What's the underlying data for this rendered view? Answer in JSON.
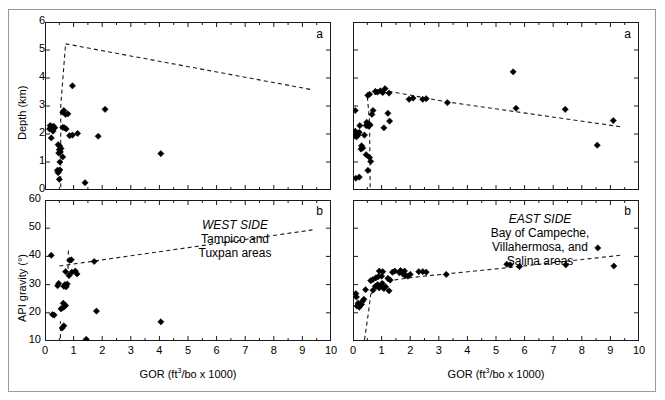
{
  "figure": {
    "axis_labels": {
      "x": "GOR (ft3/bo x 1000)",
      "x_main": "GOR (ft",
      "x_sup": "3",
      "x_rest": "/bo x 1000)",
      "y_depth": "Depth (km)",
      "y_api": "API gravity (°)"
    },
    "panel_letters": {
      "a": "a",
      "b": "b"
    }
  },
  "annotations": {
    "west": {
      "title": "WEST SIDE",
      "lines": [
        "Tampico and",
        "Tuxpan areas"
      ]
    },
    "east": {
      "title": "EAST SIDE",
      "lines": [
        "Bay of Campeche,",
        "Villahermosa, and",
        "Salina areas"
      ]
    }
  },
  "chart_data": [
    {
      "id": "west-depth",
      "type": "scatter",
      "panel": "a",
      "title": "",
      "xlabel": "GOR (ft3/bo x 1000)",
      "ylabel": "Depth (km)",
      "xlim": [
        0,
        10
      ],
      "ylim": [
        6,
        0
      ],
      "y_inverted": true,
      "xticks": [
        0,
        1,
        2,
        3,
        4,
        5,
        6,
        7,
        8,
        9,
        10
      ],
      "yticks": [
        0,
        1,
        2,
        3,
        4,
        5,
        6
      ],
      "xminor_step": 0.5,
      "grid": false,
      "legend": "none",
      "points": [
        [
          0.46,
          0.62
        ],
        [
          0.47,
          0.68
        ],
        [
          0.43,
          0.7
        ],
        [
          0.52,
          0.72
        ],
        [
          0.5,
          0.38
        ],
        [
          1.4,
          0.26
        ],
        [
          0.52,
          1.0
        ],
        [
          0.62,
          1.18
        ],
        [
          0.48,
          1.32
        ],
        [
          0.54,
          1.36
        ],
        [
          0.5,
          1.44
        ],
        [
          0.56,
          1.48
        ],
        [
          0.52,
          1.56
        ],
        [
          0.46,
          1.62
        ],
        [
          4.05,
          1.3
        ],
        [
          0.22,
          1.86
        ],
        [
          0.28,
          2.1
        ],
        [
          0.16,
          2.18
        ],
        [
          0.2,
          2.22
        ],
        [
          0.24,
          2.26
        ],
        [
          0.18,
          2.3
        ],
        [
          0.3,
          2.28
        ],
        [
          0.34,
          2.22
        ],
        [
          0.62,
          2.24
        ],
        [
          0.68,
          2.22
        ],
        [
          0.74,
          2.18
        ],
        [
          0.86,
          1.94
        ],
        [
          0.96,
          1.96
        ],
        [
          1.14,
          2.02
        ],
        [
          1.86,
          1.92
        ],
        [
          0.62,
          2.78
        ],
        [
          0.66,
          2.84
        ],
        [
          0.72,
          2.7
        ],
        [
          0.8,
          2.72
        ],
        [
          2.1,
          2.88
        ],
        [
          0.96,
          3.72
        ]
      ],
      "trend_lines": [
        {
          "name": "lower-bound-vertical",
          "style": "dashed",
          "path": [
            [
              0.55,
              0.1
            ],
            [
              0.55,
              3.0
            ],
            [
              0.72,
              5.22
            ]
          ]
        },
        {
          "name": "lower-envelope",
          "style": "dashed",
          "path": [
            [
              0.72,
              5.22
            ],
            [
              9.35,
              3.58
            ]
          ]
        }
      ]
    },
    {
      "id": "west-api",
      "type": "scatter",
      "panel": "b",
      "title": "",
      "xlabel": "GOR (ft3/bo x 1000)",
      "ylabel": "API gravity (°)",
      "xlim": [
        0,
        10
      ],
      "ylim": [
        60,
        10
      ],
      "y_inverted": true,
      "xticks": [
        0,
        1,
        2,
        3,
        4,
        5,
        6,
        7,
        8,
        9,
        10
      ],
      "yticks": [
        10,
        20,
        30,
        40,
        50,
        60
      ],
      "xminor_step": 0.5,
      "grid": false,
      "legend": "none",
      "points": [
        [
          1.44,
          10.6
        ],
        [
          0.6,
          14.6
        ],
        [
          0.66,
          15.4
        ],
        [
          4.05,
          16.8
        ],
        [
          0.26,
          19.4
        ],
        [
          0.32,
          19.2
        ],
        [
          0.56,
          21.4
        ],
        [
          0.62,
          21.8
        ],
        [
          0.68,
          22.2
        ],
        [
          0.72,
          22.6
        ],
        [
          0.64,
          23.4
        ],
        [
          1.8,
          20.6
        ],
        [
          0.44,
          29.6
        ],
        [
          0.48,
          30.4
        ],
        [
          0.66,
          29.4
        ],
        [
          0.7,
          30.0
        ],
        [
          0.74,
          29.2
        ],
        [
          0.78,
          30.2
        ],
        [
          0.84,
          33.2
        ],
        [
          0.72,
          34.6
        ],
        [
          0.94,
          34.4
        ],
        [
          1.06,
          34.8
        ],
        [
          1.12,
          33.8
        ],
        [
          0.86,
          38.6
        ],
        [
          0.92,
          38.8
        ],
        [
          1.72,
          38.2
        ],
        [
          0.22,
          40.4
        ]
      ],
      "trend_lines": [
        {
          "name": "left-boundary-vertical",
          "style": "dashed",
          "path": [
            [
              0.54,
              11.0
            ],
            [
              0.54,
              17.0
            ]
          ]
        },
        {
          "name": "left-boundary-vertical-2",
          "style": "dashed",
          "path": [
            [
              0.8,
              33.0
            ],
            [
              0.82,
              42.5
            ]
          ]
        },
        {
          "name": "api-envelope",
          "style": "dashed",
          "path": [
            [
              0.5,
              36.6
            ],
            [
              9.35,
              49.4
            ]
          ]
        }
      ]
    },
    {
      "id": "east-depth",
      "type": "scatter",
      "panel": "a",
      "title": "",
      "xlabel": "GOR (ft3/bo x 1000)",
      "ylabel": "Depth (km)",
      "xlim": [
        0,
        10
      ],
      "ylim": [
        6,
        0
      ],
      "y_inverted": true,
      "xticks": [
        0,
        1,
        2,
        3,
        4,
        5,
        6,
        7,
        8,
        9,
        10
      ],
      "yticks": [
        0,
        1,
        2,
        3,
        4,
        5,
        6
      ],
      "xminor_step": 0.5,
      "grid": false,
      "legend": "none",
      "points": [
        [
          0.1,
          0.42
        ],
        [
          0.22,
          0.46
        ],
        [
          0.52,
          0.7
        ],
        [
          0.62,
          1.02
        ],
        [
          0.46,
          1.26
        ],
        [
          0.58,
          1.16
        ],
        [
          0.28,
          1.46
        ],
        [
          0.34,
          1.5
        ],
        [
          0.3,
          1.58
        ],
        [
          0.06,
          1.94
        ],
        [
          0.12,
          1.9
        ],
        [
          0.18,
          1.96
        ],
        [
          0.14,
          2.02
        ],
        [
          0.22,
          2.06
        ],
        [
          0.08,
          2.1
        ],
        [
          0.4,
          1.96
        ],
        [
          0.24,
          2.3
        ],
        [
          0.46,
          2.3
        ],
        [
          0.5,
          2.34
        ],
        [
          0.54,
          2.28
        ],
        [
          0.56,
          2.36
        ],
        [
          0.6,
          2.32
        ],
        [
          0.48,
          2.42
        ],
        [
          1.08,
          2.22
        ],
        [
          1.28,
          2.46
        ],
        [
          1.22,
          2.74
        ],
        [
          0.66,
          2.7
        ],
        [
          0.7,
          2.84
        ],
        [
          0.08,
          2.84
        ],
        [
          0.52,
          3.38
        ],
        [
          0.58,
          3.42
        ],
        [
          0.78,
          3.52
        ],
        [
          0.86,
          3.5
        ],
        [
          0.96,
          3.54
        ],
        [
          1.04,
          3.48
        ],
        [
          1.12,
          3.62
        ],
        [
          1.26,
          3.46
        ],
        [
          1.96,
          3.24
        ],
        [
          2.1,
          3.28
        ],
        [
          2.44,
          3.24
        ],
        [
          2.56,
          3.26
        ],
        [
          3.3,
          3.12
        ],
        [
          5.6,
          4.22
        ],
        [
          5.7,
          2.92
        ],
        [
          7.42,
          2.88
        ],
        [
          8.54,
          1.6
        ],
        [
          9.1,
          2.48
        ]
      ],
      "trend_lines": [
        {
          "name": "left-boundary-vertical",
          "style": "dashed",
          "path": [
            [
              0.6,
              0.1
            ],
            [
              0.58,
              2.4
            ],
            [
              0.5,
              3.36
            ]
          ]
        },
        {
          "name": "lower-envelope",
          "style": "dashed",
          "path": [
            [
              0.5,
              3.36
            ],
            [
              1.3,
              3.52
            ],
            [
              3.2,
              3.16
            ],
            [
              9.35,
              2.26
            ]
          ]
        }
      ]
    },
    {
      "id": "east-api",
      "type": "scatter",
      "panel": "b",
      "title": "",
      "xlabel": "GOR (ft3/bo x 1000)",
      "ylabel": "API gravity (°)",
      "xlim": [
        0,
        10
      ],
      "ylim": [
        60,
        10
      ],
      "y_inverted": true,
      "xticks": [
        0,
        1,
        2,
        3,
        4,
        5,
        6,
        7,
        8,
        9,
        10
      ],
      "yticks": [
        10,
        20,
        30,
        40,
        50,
        60
      ],
      "xminor_step": 0.5,
      "grid": false,
      "legend": "none",
      "points": [
        [
          0.14,
          22.4
        ],
        [
          0.22,
          22.0
        ],
        [
          0.26,
          22.6
        ],
        [
          0.18,
          23.4
        ],
        [
          0.3,
          23.0
        ],
        [
          0.34,
          24.2
        ],
        [
          0.38,
          24.8
        ],
        [
          0.12,
          25.6
        ],
        [
          0.1,
          26.8
        ],
        [
          0.44,
          28.2
        ],
        [
          0.7,
          28.0
        ],
        [
          0.78,
          29.4
        ],
        [
          0.86,
          30.0
        ],
        [
          0.92,
          28.8
        ],
        [
          0.96,
          29.6
        ],
        [
          1.02,
          30.4
        ],
        [
          1.08,
          28.6
        ],
        [
          1.14,
          29.2
        ],
        [
          1.26,
          27.8
        ],
        [
          0.62,
          31.4
        ],
        [
          0.7,
          31.8
        ],
        [
          0.8,
          32.4
        ],
        [
          0.88,
          32.8
        ],
        [
          1.0,
          33.0
        ],
        [
          1.22,
          32.2
        ],
        [
          1.3,
          31.6
        ],
        [
          0.92,
          34.8
        ],
        [
          1.04,
          34.6
        ],
        [
          1.38,
          34.4
        ],
        [
          1.46,
          34.8
        ],
        [
          1.62,
          34.2
        ],
        [
          1.7,
          34.4
        ],
        [
          1.76,
          33.6
        ],
        [
          1.84,
          33.2
        ],
        [
          1.92,
          33.0
        ],
        [
          2.0,
          33.6
        ],
        [
          1.66,
          35.0
        ],
        [
          1.8,
          34.8
        ],
        [
          2.3,
          34.6
        ],
        [
          2.44,
          34.6
        ],
        [
          2.56,
          34.4
        ],
        [
          3.26,
          33.6
        ],
        [
          5.38,
          37.2
        ],
        [
          5.5,
          37.0
        ],
        [
          5.82,
          36.4
        ],
        [
          7.44,
          37.0
        ],
        [
          8.56,
          43.0
        ],
        [
          9.12,
          36.6
        ]
      ],
      "trend_lines": [
        {
          "name": "left-boundary-vertical",
          "style": "dashed",
          "path": [
            [
              0.4,
              10.4
            ],
            [
              0.54,
              20.0
            ],
            [
              0.62,
              26.6
            ]
          ]
        },
        {
          "name": "api-envelope",
          "style": "dashed",
          "path": [
            [
              0.62,
              26.6
            ],
            [
              1.1,
              31.2
            ],
            [
              2.3,
              32.8
            ],
            [
              5.6,
              36.2
            ],
            [
              9.35,
              40.4
            ]
          ]
        }
      ]
    }
  ]
}
